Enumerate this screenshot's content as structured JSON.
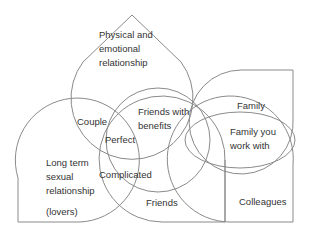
{
  "diagram": {
    "title": "",
    "stroke_color": "#8a8a8a",
    "text_color": "#333333",
    "labels": {
      "physical": [
        "Physical and",
        "emotional",
        "relationship"
      ],
      "couple": "Couple",
      "friends_with_benefits": [
        "Friends with",
        "benefits"
      ],
      "perfect": "Perfect",
      "long_term": [
        "Long term",
        "sexual",
        "relationship"
      ],
      "lovers": "(lovers)",
      "complicated": "Complicated",
      "friends": "Friends",
      "family": "Family",
      "family_work": [
        "Family you",
        "work with"
      ],
      "colleagues": "Colleagues"
    }
  }
}
